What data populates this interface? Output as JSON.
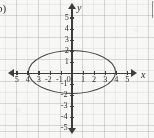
{
  "figure": {
    "item_label": "b)",
    "background": "#fbfbf9",
    "ink_color": "#3b3b3b",
    "grid_color": "#7a8490"
  },
  "axes": {
    "x_name": "x",
    "y_name": "y",
    "x_ticks": [
      {
        "value": -5,
        "label": "5"
      },
      {
        "value": -4,
        "label": "4"
      },
      {
        "value": -3,
        "label": "3"
      },
      {
        "value": -2,
        "label": "-2"
      },
      {
        "value": -1,
        "label": "-1"
      },
      {
        "value": 1,
        "label": "1"
      },
      {
        "value": 2,
        "label": "2"
      },
      {
        "value": 3,
        "label": "3"
      },
      {
        "value": 4,
        "label": "4"
      },
      {
        "value": 5,
        "label": "5"
      }
    ],
    "y_ticks": [
      {
        "value": 5,
        "label": "5"
      },
      {
        "value": 4,
        "label": "4"
      },
      {
        "value": 3,
        "label": "3"
      },
      {
        "value": 2,
        "label": "2"
      },
      {
        "value": 1,
        "label": "1"
      },
      {
        "value": -1,
        "label": "-1"
      },
      {
        "value": -2,
        "label": "-2"
      },
      {
        "value": -3,
        "label": "-3"
      },
      {
        "value": -4,
        "label": "-4"
      },
      {
        "value": -5,
        "label": "-5"
      }
    ],
    "origin_label": "0"
  },
  "chart_data": {
    "type": "line",
    "title": "b)",
    "xlabel": "x",
    "ylabel": "y",
    "xlim": [
      -5.8,
      5.8
    ],
    "ylim": [
      -5.8,
      5.8
    ],
    "grid": true,
    "legend": "none",
    "series": [
      {
        "name": "ellipse",
        "shape": "ellipse",
        "center": [
          0,
          0
        ],
        "semi_axis_x": 4,
        "semi_axis_y": 2,
        "equation": "x^2/16 + y^2/4 = 1",
        "x_intercepts": [
          -4,
          4
        ],
        "y_intercepts": [
          -2,
          2
        ]
      }
    ],
    "annotations": []
  }
}
